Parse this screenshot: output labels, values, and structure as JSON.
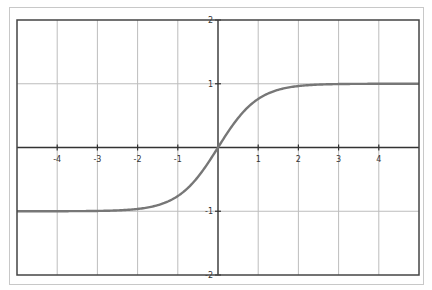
{
  "chart_data": {
    "type": "line",
    "title": "",
    "xlabel": "",
    "ylabel": "",
    "function": "tanh(x)",
    "xlim": [
      -5,
      5
    ],
    "ylim": [
      -2,
      2
    ],
    "grid": true,
    "legend": null,
    "x_ticks": [
      -4,
      -3,
      -2,
      -1,
      1,
      2,
      3,
      4
    ],
    "x_tick_labels": [
      "-4",
      "-3",
      "-2",
      "-1",
      "1",
      "2",
      "3",
      "4"
    ],
    "y_ticks": [
      2,
      1,
      -1,
      -2
    ],
    "y_tick_labels": [
      "2",
      "1",
      "-1",
      "-2"
    ],
    "series": [
      {
        "name": "tanh(x)",
        "color": "#777777",
        "x": [
          -5,
          -4,
          -3,
          -2.5,
          -2,
          -1.5,
          -1,
          -0.5,
          0,
          0.5,
          1,
          1.5,
          2,
          2.5,
          3,
          4,
          5
        ],
        "y": [
          -1.0,
          -0.999,
          -0.995,
          -0.987,
          -0.964,
          -0.905,
          -0.762,
          -0.462,
          0,
          0.462,
          0.762,
          0.905,
          0.964,
          0.987,
          0.995,
          0.999,
          1.0
        ]
      }
    ]
  },
  "colors": {
    "curve": "#777777",
    "grid": "#bdbdbd",
    "axis": "#333333",
    "border": "#444444",
    "frame": "#c8c8c8"
  }
}
